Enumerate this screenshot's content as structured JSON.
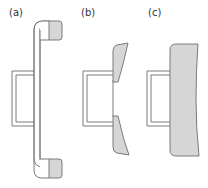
{
  "figure": {
    "panels": [
      {
        "id": "a",
        "label": "(a)"
      },
      {
        "id": "b",
        "label": "(b)"
      },
      {
        "id": "c",
        "label": "(c)"
      }
    ]
  },
  "colors": {
    "stroke": "#7a7a7a",
    "fill_gray": "#d6d6d6",
    "fill_white": "#ffffff",
    "label": "#333333"
  }
}
